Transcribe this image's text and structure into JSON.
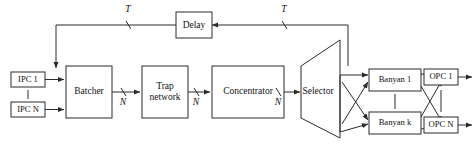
{
  "diagram": {
    "colors": {
      "line": "#2b2b2b",
      "box_fill": "#ffffff",
      "background": "#ffffff",
      "text": "#111111"
    },
    "inputs": [
      {
        "id": "ipc1",
        "label": "IPC 1"
      },
      {
        "id": "ipcN",
        "label": "IPC N"
      }
    ],
    "stages": [
      {
        "id": "batcher",
        "label": "Batcher"
      },
      {
        "id": "trap",
        "label_line1": "Trap",
        "label_line2": "network"
      },
      {
        "id": "concentrator",
        "label": "Concentrator"
      },
      {
        "id": "selector",
        "label": "Selector"
      }
    ],
    "banyans": [
      {
        "id": "banyan1",
        "label": "Banyan 1"
      },
      {
        "id": "banyank",
        "label": "Banyan k"
      }
    ],
    "outputs": [
      {
        "id": "opc1",
        "label": "OPC 1"
      },
      {
        "id": "opcN",
        "label": "OPC N"
      }
    ],
    "feedback": {
      "delay_label": "Delay",
      "tag_left": "T",
      "tag_right": "T"
    },
    "link_labels": {
      "batcher_to_trap": "N",
      "trap_to_concentrator": "N",
      "concentrator_to_selector": "N"
    }
  }
}
